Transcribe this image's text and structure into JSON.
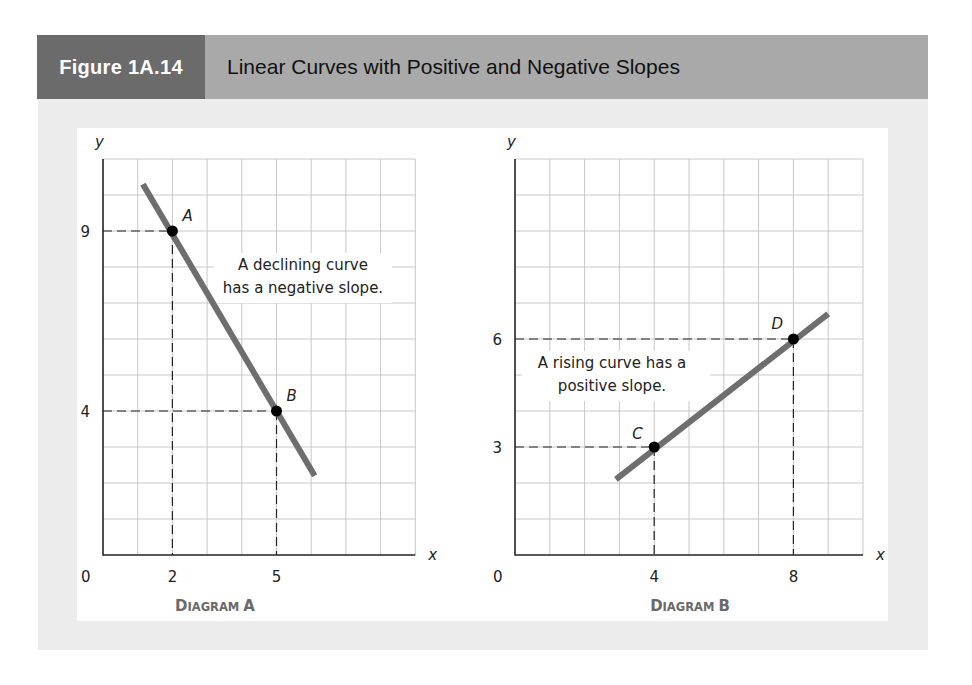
{
  "header": {
    "figure_number": "Figure 1A.14",
    "title": "Linear Curves with Positive and Negative Slopes",
    "number_bg": "#6b6b6b",
    "title_bg": "#a9a9a9"
  },
  "colors": {
    "panel_bg": "#ececec",
    "plot_bg": "#ffffff",
    "grid": "#c8c8c8",
    "axis": "#222222",
    "curve": "#6e6e6e",
    "point": "#000000",
    "caption": "#6a6a6a"
  },
  "chart_data": [
    {
      "type": "line",
      "title": "Diagram A",
      "caption": "DIAGRAM A",
      "xlabel": "x",
      "ylabel": "y",
      "origin_label": "0",
      "xlim": [
        0,
        9
      ],
      "ylim": [
        0,
        11
      ],
      "grid": true,
      "x_ticks": [
        2,
        5
      ],
      "y_ticks": [
        9,
        4
      ],
      "x_tick_labels": [
        "2",
        "5"
      ],
      "y_tick_labels": [
        "9",
        "4"
      ],
      "series": [
        {
          "name": "declining curve",
          "x": [
            1.15,
            6.1
          ],
          "y": [
            10.3,
            2.2
          ]
        }
      ],
      "points": [
        {
          "label": "A",
          "x": 2,
          "y": 9
        },
        {
          "label": "B",
          "x": 5,
          "y": 4
        }
      ],
      "annotation": [
        "A declining curve",
        "has a negative slope."
      ],
      "slope": -1.667
    },
    {
      "type": "line",
      "title": "Diagram B",
      "caption": "DIAGRAM B",
      "xlabel": "x",
      "ylabel": "y",
      "origin_label": "0",
      "xlim": [
        0,
        10
      ],
      "ylim": [
        0,
        11
      ],
      "grid": true,
      "x_ticks": [
        4,
        8
      ],
      "y_ticks": [
        6,
        3
      ],
      "x_tick_labels": [
        "4",
        "8"
      ],
      "y_tick_labels": [
        "6",
        "3"
      ],
      "series": [
        {
          "name": "rising curve",
          "x": [
            2.9,
            9.0
          ],
          "y": [
            2.1,
            6.7
          ]
        }
      ],
      "points": [
        {
          "label": "C",
          "x": 4,
          "y": 3
        },
        {
          "label": "D",
          "x": 8,
          "y": 6
        }
      ],
      "annotation": [
        "A rising curve has a",
        "positive slope."
      ],
      "slope": 0.75
    }
  ],
  "captions": {
    "a_prefix": "D",
    "a_rest": "IAGRAM",
    "a_letter": "A",
    "b_prefix": "D",
    "b_rest": "IAGRAM",
    "b_letter": "B"
  }
}
